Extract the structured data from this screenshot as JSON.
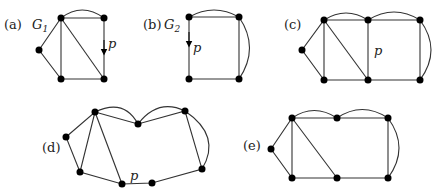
{
  "figure": {
    "panels": [
      {
        "id": "a",
        "label": "(a)",
        "graph_name": "G",
        "graph_sub": "1",
        "path_label": "p"
      },
      {
        "id": "b",
        "label": "(b)",
        "graph_name": "G",
        "graph_sub": "2",
        "path_label": "p"
      },
      {
        "id": "c",
        "label": "(c)",
        "path_label": "p"
      },
      {
        "id": "d",
        "label": "(d)",
        "path_label": "p"
      },
      {
        "id": "e",
        "label": "(e)"
      }
    ]
  },
  "colors": {
    "edge": "#333333",
    "node": "#000000",
    "background": "#ffffff"
  }
}
